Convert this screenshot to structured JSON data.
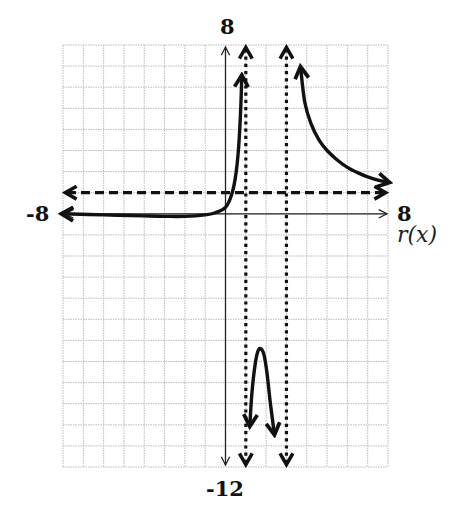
{
  "chart_data": {
    "type": "line",
    "title": "",
    "xlabel": "",
    "ylabel": "r(x)",
    "xlim": [
      -8,
      8
    ],
    "ylim": [
      -12,
      8
    ],
    "grid": true,
    "grid_step": 1,
    "tick_labels": {
      "x_min": "-8",
      "x_max": "8",
      "y_max": "8",
      "y_min": "-12"
    },
    "function_label": "r(x)",
    "asymptotes": {
      "vertical": [
        1,
        3
      ],
      "horizontal": [
        1
      ]
    },
    "series": [
      {
        "name": "branch-left",
        "x": [
          -8,
          -6,
          -4,
          -3,
          -2,
          -1,
          -0.5,
          0,
          0.3,
          0.5,
          0.65,
          0.75,
          0.8
        ],
        "y": [
          0,
          -0.05,
          -0.1,
          -0.12,
          -0.12,
          -0.05,
          0.05,
          0.3,
          0.9,
          1.8,
          3.2,
          5.0,
          6.5
        ],
        "arrow_start": true,
        "arrow_end": true
      },
      {
        "name": "branch-middle",
        "x": [
          1.2,
          1.3,
          1.45,
          1.6,
          1.75,
          1.9,
          2.05,
          2.2,
          2.4
        ],
        "y": [
          -10,
          -8.5,
          -7.2,
          -6.5,
          -6.4,
          -6.7,
          -7.6,
          -8.9,
          -10.4
        ],
        "arrow_start": true,
        "arrow_end": true
      },
      {
        "name": "branch-right",
        "x": [
          3.7,
          3.9,
          4.2,
          4.6,
          5,
          5.5,
          6,
          6.5,
          7,
          7.5,
          8
        ],
        "y": [
          6.9,
          5.3,
          4.3,
          3.5,
          3.0,
          2.55,
          2.2,
          1.95,
          1.75,
          1.6,
          1.5
        ],
        "arrow_start": true,
        "arrow_end": true
      }
    ]
  },
  "labels": {
    "y_max": "8",
    "y_min": "-12",
    "x_min": "-8",
    "x_max": "8",
    "function": "r(x)"
  },
  "colors": {
    "curve": "#111111",
    "grid": "#bbbbbb",
    "axis": "#222222"
  }
}
